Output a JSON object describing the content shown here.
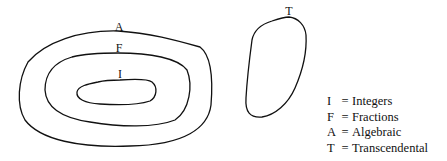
{
  "diagram": {
    "regions": [
      {
        "key": "A",
        "name": "Algebraic"
      },
      {
        "key": "F",
        "name": "Fractions"
      },
      {
        "key": "I",
        "name": "Integers"
      },
      {
        "key": "T",
        "name": "Transcendental"
      }
    ],
    "labels": {
      "A": "A",
      "F": "F",
      "I": "I",
      "T": "T"
    }
  },
  "legend": {
    "items": [
      {
        "key": "I",
        "eq": "=",
        "name": "Integers"
      },
      {
        "key": "F",
        "eq": "=",
        "name": "Fractions"
      },
      {
        "key": "A",
        "eq": "=",
        "name": "Algebraic"
      },
      {
        "key": "T",
        "eq": "=",
        "name": "Transcendental"
      }
    ]
  }
}
